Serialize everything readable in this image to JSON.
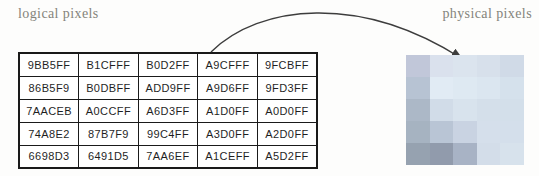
{
  "labels": {
    "logical": "logical pixels",
    "physical": "physical pixels"
  },
  "table": {
    "rows": [
      [
        "9BB5FF",
        "B1CFFF",
        "B0D2FF",
        "A9CFFF",
        "9FCBFF"
      ],
      [
        "86B5F9",
        "B0DBFF",
        "ADD9FF",
        "A9D6FF",
        "9FD3FF"
      ],
      [
        "7AACEB",
        "A0CCFF",
        "A6D3FF",
        "A1D0FF",
        "A0D0FF"
      ],
      [
        "74A8E2",
        "87B7F9",
        "99C4FF",
        "A3D0FF",
        "A2D0FF"
      ],
      [
        "6698D3",
        "6491D5",
        "7AA6EF",
        "A1CEFF",
        "A5D2FF"
      ]
    ]
  },
  "colors": {
    "label_text": "#84847b",
    "cell_text": "#1f1f1f",
    "table_border": "#1a1a1a",
    "arrow": "#3d3d3d",
    "page_bg": "#fdfdfc"
  }
}
